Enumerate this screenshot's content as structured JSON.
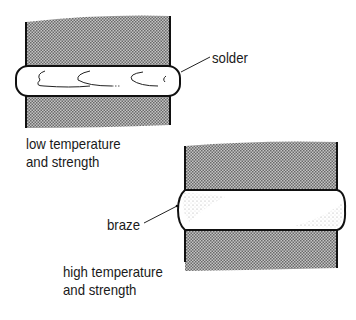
{
  "diagram": {
    "type": "joint comparison",
    "joints": [
      {
        "id": "solder-joint",
        "label": "solder",
        "caption_line1": "low temperature",
        "caption_line2": "and strength"
      },
      {
        "id": "braze-joint",
        "label": "braze",
        "caption_line1": "high temperature",
        "caption_line2": "and strength"
      }
    ],
    "colors": {
      "metal_hatch": "#8a8a8a",
      "outline": "#111111",
      "filler": "#ffffff"
    }
  }
}
